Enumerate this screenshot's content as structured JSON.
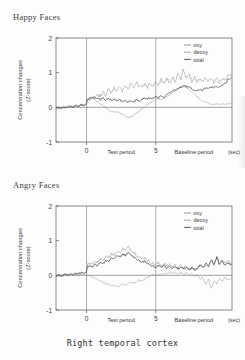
{
  "document": {
    "caption": "Right temporal cortex"
  },
  "axis": {
    "ylabel_line1": "Concentration changes",
    "ylabel_line2": "(Z-score)",
    "yticks": [
      "2",
      "1",
      "0",
      "-1"
    ],
    "ytick_values": [
      2,
      1,
      0,
      -1
    ],
    "xticks": [
      "0",
      "5"
    ],
    "xtick_values": [
      0,
      5
    ],
    "xunit": "(sec)",
    "region_labels": [
      "Test period",
      "Baseline period"
    ]
  },
  "legend": {
    "items": [
      {
        "label": "oxy",
        "color": "#8a8a8a"
      },
      {
        "label": "deoxy",
        "color": "#9a9a9a"
      },
      {
        "label": "total",
        "color": "#4a4a4a"
      }
    ]
  },
  "chart_data": [
    {
      "type": "line",
      "title": "Happy Faces",
      "xlabel": "(sec)",
      "ylabel": "Concentration changes (Z-score)",
      "xlim": [
        -2.2,
        10.5
      ],
      "ylim": [
        -1,
        2
      ],
      "xticks": [
        0,
        5
      ],
      "yticks": [
        -1,
        0,
        1,
        2
      ],
      "grid": false,
      "legend_position": "top-right",
      "annotations": [
        "Test period",
        "Baseline period"
      ],
      "series": [
        {
          "name": "oxy",
          "color": "#8a8a8a",
          "x": [
            -2.2,
            -2.0,
            -1.8,
            -1.6,
            -1.4,
            -1.2,
            -1.0,
            -0.8,
            -0.6,
            -0.4,
            -0.2,
            0.0,
            0.2,
            0.4,
            0.6,
            0.8,
            1.0,
            1.2,
            1.4,
            1.6,
            1.8,
            2.0,
            2.2,
            2.4,
            2.6,
            2.8,
            3.0,
            3.2,
            3.4,
            3.6,
            3.8,
            4.0,
            4.2,
            4.4,
            4.6,
            4.8,
            5.0,
            5.2,
            5.4,
            5.6,
            5.8,
            6.0,
            6.2,
            6.4,
            6.6,
            6.8,
            7.0,
            7.2,
            7.4,
            7.6,
            7.8,
            8.0,
            8.2,
            8.4,
            8.6,
            8.8,
            9.0,
            9.2,
            9.4,
            9.6,
            9.8,
            10.0,
            10.2,
            10.5
          ],
          "y": [
            -0.06,
            0.02,
            -0.04,
            0.06,
            0.0,
            0.1,
            0.04,
            0.14,
            0.08,
            0.2,
            0.14,
            0.26,
            0.22,
            0.32,
            0.26,
            0.38,
            0.3,
            0.44,
            0.34,
            0.52,
            0.4,
            0.58,
            0.44,
            0.62,
            0.48,
            0.66,
            0.5,
            0.7,
            0.54,
            0.74,
            0.56,
            0.62,
            0.68,
            0.58,
            0.72,
            0.6,
            0.76,
            0.62,
            0.8,
            0.66,
            0.84,
            0.7,
            0.88,
            0.74,
            1.02,
            0.78,
            1.1,
            0.82,
            0.96,
            0.74,
            0.88,
            0.7,
            0.86,
            0.72,
            0.9,
            0.74,
            0.88,
            0.72,
            0.86,
            0.7,
            0.84,
            0.78,
            0.92,
            0.96
          ]
        },
        {
          "name": "deoxy",
          "color": "#9a9a9a",
          "x": [
            -2.2,
            -2.0,
            -1.8,
            -1.6,
            -1.4,
            -1.2,
            -1.0,
            -0.8,
            -0.6,
            -0.4,
            -0.2,
            0.0,
            0.2,
            0.4,
            0.6,
            0.8,
            1.0,
            1.2,
            1.4,
            1.6,
            1.8,
            2.0,
            2.2,
            2.4,
            2.6,
            2.8,
            3.0,
            3.2,
            3.4,
            3.6,
            3.8,
            4.0,
            4.2,
            4.4,
            4.6,
            4.8,
            5.0,
            5.2,
            5.4,
            5.6,
            5.8,
            6.0,
            6.2,
            6.4,
            6.6,
            6.8,
            7.0,
            7.2,
            7.4,
            7.6,
            7.8,
            8.0,
            8.2,
            8.4,
            8.6,
            8.8,
            9.0,
            9.2,
            9.4,
            9.6,
            9.8,
            10.0,
            10.2,
            10.5
          ],
          "y": [
            -0.1,
            -0.06,
            -0.08,
            -0.02,
            -0.05,
            0.02,
            0.0,
            0.06,
            0.04,
            0.12,
            0.1,
            0.2,
            0.24,
            0.26,
            0.22,
            0.16,
            0.1,
            0.04,
            -0.02,
            -0.08,
            -0.12,
            -0.14,
            -0.12,
            -0.16,
            -0.2,
            -0.26,
            -0.3,
            -0.28,
            -0.22,
            -0.16,
            -0.1,
            -0.04,
            0.02,
            0.08,
            0.14,
            0.18,
            0.22,
            0.24,
            0.22,
            0.26,
            0.3,
            0.36,
            0.42,
            0.48,
            0.52,
            0.56,
            0.58,
            0.56,
            0.52,
            0.46,
            0.38,
            0.3,
            0.24,
            0.18,
            0.14,
            0.12,
            0.1,
            0.08,
            0.1,
            0.08,
            0.1,
            0.08,
            0.1,
            0.12
          ]
        },
        {
          "name": "total",
          "color": "#4a4a4a",
          "x": [
            -2.2,
            -2.0,
            -1.8,
            -1.6,
            -1.4,
            -1.2,
            -1.0,
            -0.8,
            -0.6,
            -0.4,
            -0.2,
            0.0,
            0.2,
            0.4,
            0.6,
            0.8,
            1.0,
            1.2,
            1.4,
            1.6,
            1.8,
            2.0,
            2.2,
            2.4,
            2.6,
            2.8,
            3.0,
            3.2,
            3.4,
            3.6,
            3.8,
            4.0,
            4.2,
            4.4,
            4.6,
            4.8,
            5.0,
            5.2,
            5.4,
            5.6,
            5.8,
            6.0,
            6.2,
            6.4,
            6.6,
            6.8,
            7.0,
            7.2,
            7.4,
            7.6,
            7.8,
            8.0,
            8.2,
            8.4,
            8.6,
            8.8,
            9.0,
            9.2,
            9.4,
            9.6,
            9.8,
            10.0,
            10.2,
            10.5
          ],
          "y": [
            -0.08,
            -0.02,
            -0.06,
            0.02,
            -0.02,
            0.06,
            0.02,
            0.1,
            0.06,
            0.16,
            0.12,
            0.24,
            0.26,
            0.3,
            0.26,
            0.28,
            0.22,
            0.26,
            0.2,
            0.26,
            0.2,
            0.24,
            0.18,
            0.22,
            0.16,
            0.2,
            0.14,
            0.2,
            0.16,
            0.22,
            0.18,
            0.24,
            0.26,
            0.24,
            0.28,
            0.26,
            0.3,
            0.28,
            0.32,
            0.3,
            0.36,
            0.4,
            0.46,
            0.5,
            0.56,
            0.58,
            0.62,
            0.6,
            0.58,
            0.54,
            0.5,
            0.48,
            0.52,
            0.5,
            0.56,
            0.54,
            0.58,
            0.56,
            0.6,
            0.58,
            0.64,
            0.68,
            0.8,
            0.88
          ]
        }
      ]
    },
    {
      "type": "line",
      "title": "Angry Faces",
      "xlabel": "(sec)",
      "ylabel": "Concentration changes (Z-score)",
      "xlim": [
        -2.2,
        10.5
      ],
      "ylim": [
        -1,
        2
      ],
      "xticks": [
        0,
        5
      ],
      "yticks": [
        -1,
        0,
        1,
        2
      ],
      "grid": false,
      "legend_position": "top-right",
      "annotations": [
        "Test period",
        "Baseline period"
      ],
      "series": [
        {
          "name": "oxy",
          "color": "#8a8a8a",
          "x": [
            -2.2,
            -2.0,
            -1.8,
            -1.6,
            -1.4,
            -1.2,
            -1.0,
            -0.8,
            -0.6,
            -0.4,
            -0.2,
            0.0,
            0.2,
            0.4,
            0.6,
            0.8,
            1.0,
            1.2,
            1.4,
            1.6,
            1.8,
            2.0,
            2.2,
            2.4,
            2.6,
            2.8,
            3.0,
            3.2,
            3.4,
            3.6,
            3.8,
            4.0,
            4.2,
            4.4,
            4.6,
            4.8,
            5.0,
            5.2,
            5.4,
            5.6,
            5.8,
            6.0,
            6.2,
            6.4,
            6.6,
            6.8,
            7.0,
            7.2,
            7.4,
            7.6,
            7.8,
            8.0,
            8.2,
            8.4,
            8.6,
            8.8,
            9.0,
            9.2,
            9.4,
            9.6,
            9.8,
            10.0,
            10.2,
            10.5
          ],
          "y": [
            -0.04,
            0.04,
            -0.02,
            0.08,
            0.02,
            0.1,
            0.06,
            0.14,
            0.1,
            0.2,
            0.16,
            0.28,
            0.34,
            0.3,
            0.4,
            0.36,
            0.48,
            0.44,
            0.56,
            0.52,
            0.62,
            0.58,
            0.7,
            0.64,
            0.78,
            0.7,
            0.82,
            0.74,
            0.68,
            0.6,
            0.54,
            0.46,
            0.52,
            0.44,
            0.38,
            0.34,
            0.3,
            0.36,
            0.28,
            0.34,
            0.26,
            0.32,
            0.24,
            0.3,
            0.22,
            0.28,
            0.2,
            0.26,
            0.18,
            0.24,
            0.16,
            0.22,
            0.3,
            0.24,
            0.34,
            0.26,
            0.44,
            0.3,
            0.52,
            0.34,
            0.46,
            0.3,
            0.4,
            0.34
          ]
        },
        {
          "name": "deoxy",
          "color": "#9a9a9a",
          "x": [
            -2.2,
            -2.0,
            -1.8,
            -1.6,
            -1.4,
            -1.2,
            -1.0,
            -0.8,
            -0.6,
            -0.4,
            -0.2,
            0.0,
            0.2,
            0.4,
            0.6,
            0.8,
            1.0,
            1.2,
            1.4,
            1.6,
            1.8,
            2.0,
            2.2,
            2.4,
            2.6,
            2.8,
            3.0,
            3.2,
            3.4,
            3.6,
            3.8,
            4.0,
            4.2,
            4.4,
            4.6,
            4.8,
            5.0,
            5.2,
            5.4,
            5.6,
            5.8,
            6.0,
            6.2,
            6.4,
            6.6,
            6.8,
            7.0,
            7.2,
            7.4,
            7.6,
            7.8,
            8.0,
            8.2,
            8.4,
            8.6,
            8.8,
            9.0,
            9.2,
            9.4,
            9.6,
            9.8,
            10.0,
            10.2,
            10.5
          ],
          "y": [
            -0.08,
            -0.02,
            -0.06,
            0.0,
            -0.04,
            0.02,
            -0.02,
            0.04,
            0.0,
            0.06,
            0.02,
            0.04,
            0.0,
            -0.04,
            -0.08,
            -0.12,
            -0.16,
            -0.2,
            -0.24,
            -0.26,
            -0.3,
            -0.28,
            -0.32,
            -0.3,
            -0.26,
            -0.28,
            -0.24,
            -0.2,
            -0.22,
            -0.18,
            -0.14,
            -0.16,
            -0.1,
            -0.06,
            -0.02,
            0.02,
            0.0,
            0.04,
            0.02,
            0.06,
            0.04,
            0.08,
            0.06,
            0.1,
            0.04,
            0.08,
            0.02,
            0.06,
            0.0,
            0.04,
            -0.02,
            0.02,
            -0.12,
            -0.04,
            -0.28,
            -0.1,
            -0.4,
            -0.14,
            -0.24,
            -0.08,
            -0.18,
            -0.06,
            -0.14,
            -0.08
          ]
        },
        {
          "name": "total",
          "color": "#4a4a4a",
          "x": [
            -2.2,
            -2.0,
            -1.8,
            -1.6,
            -1.4,
            -1.2,
            -1.0,
            -0.8,
            -0.6,
            -0.4,
            -0.2,
            0.0,
            0.2,
            0.4,
            0.6,
            0.8,
            1.0,
            1.2,
            1.4,
            1.6,
            1.8,
            2.0,
            2.2,
            2.4,
            2.6,
            2.8,
            3.0,
            3.2,
            3.4,
            3.6,
            3.8,
            4.0,
            4.2,
            4.4,
            4.6,
            4.8,
            5.0,
            5.2,
            5.4,
            5.6,
            5.8,
            6.0,
            6.2,
            6.4,
            6.6,
            6.8,
            7.0,
            7.2,
            7.4,
            7.6,
            7.8,
            8.0,
            8.2,
            8.4,
            8.6,
            8.8,
            9.0,
            9.2,
            9.4,
            9.6,
            9.8,
            10.0,
            10.2,
            10.5
          ],
          "y": [
            -0.06,
            0.02,
            -0.04,
            0.06,
            0.0,
            0.08,
            0.04,
            0.12,
            0.08,
            0.16,
            0.12,
            0.22,
            0.28,
            0.24,
            0.32,
            0.28,
            0.38,
            0.34,
            0.44,
            0.4,
            0.5,
            0.46,
            0.56,
            0.52,
            0.62,
            0.56,
            0.66,
            0.6,
            0.54,
            0.48,
            0.42,
            0.36,
            0.42,
            0.34,
            0.3,
            0.26,
            0.24,
            0.3,
            0.22,
            0.28,
            0.2,
            0.26,
            0.2,
            0.26,
            0.18,
            0.24,
            0.18,
            0.24,
            0.16,
            0.22,
            0.14,
            0.2,
            0.28,
            0.22,
            0.36,
            0.24,
            0.48,
            0.28,
            0.56,
            0.3,
            0.42,
            0.26,
            0.36,
            0.3
          ]
        }
      ]
    }
  ]
}
